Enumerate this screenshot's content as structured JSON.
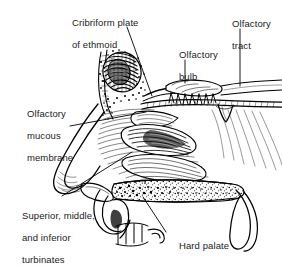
{
  "figure": {
    "type": "anatomical-line-illustration",
    "background_color": "#ffffff",
    "ink_color": "#000000",
    "text_color": "#1b1b1b",
    "width_px": 282,
    "height_px": 258
  },
  "labels": {
    "cribriform": {
      "line1": "Cribriform plate",
      "line2": "of ethmoid",
      "full": "Cribriform plate of ethmoid"
    },
    "olfactory_bulb": {
      "line1": "Olfactory",
      "line2": "bulb",
      "full": "Olfactory bulb"
    },
    "olfactory_tract": {
      "line1": "Olfactory",
      "line2": "tract",
      "full": "Olfactory tract"
    },
    "olfactory_mucous_membrane": {
      "line1": "Olfactory",
      "line2": "mucous",
      "line3": "membrane",
      "full": "Olfactory mucous membrane"
    },
    "turbinates": {
      "line1": "Superior, middle,",
      "line2": "and inferior",
      "line3": "turbinates",
      "full": "Superior, middle, and inferior turbinates"
    },
    "hard_palate": {
      "line1": "Hard palate",
      "full": "Hard palate"
    }
  },
  "structures": [
    "frontal sinus",
    "cribriform plate of ethmoid",
    "olfactory bulb",
    "olfactory tract",
    "olfactory nerve filaments",
    "olfactory mucous membrane",
    "superior turbinate",
    "middle turbinate",
    "inferior turbinate",
    "nasal vestibule",
    "hard palate",
    "soft palate",
    "uvula",
    "upper incisor teeth",
    "nasopharynx"
  ]
}
